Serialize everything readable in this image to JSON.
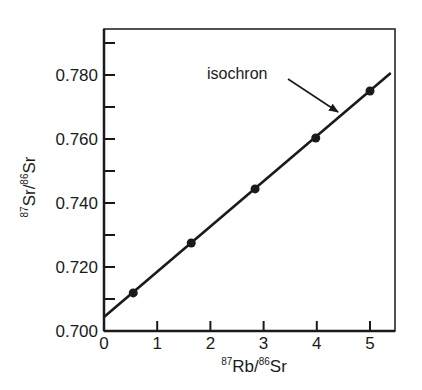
{
  "chart_data": {
    "type": "scatter",
    "title": "",
    "xlabel": {
      "sup1": "87",
      "main1": "Rb/",
      "sup2": "86",
      "main2": "Sr"
    },
    "ylabel": {
      "sup1": "87",
      "main1": "Sr/",
      "sup2": "86",
      "main2": "Sr"
    },
    "xlim": [
      0,
      5.47
    ],
    "ylim": [
      0.7,
      0.7945
    ],
    "x_ticks": [
      0,
      1,
      2,
      3,
      4,
      5
    ],
    "x_tick_labels": [
      "0",
      "1",
      "2",
      "3",
      "4",
      "5"
    ],
    "y_major_ticks": [
      0.7,
      0.72,
      0.74,
      0.76,
      0.78
    ],
    "y_tick_labels": [
      "0.700",
      "0.720",
      "0.740",
      "0.760",
      "0.780"
    ],
    "y_minor_ticks": [
      0.71,
      0.73,
      0.75,
      0.77,
      0.79
    ],
    "grid": false,
    "series": [
      {
        "name": "samples",
        "x": [
          0.55,
          1.64,
          2.84,
          3.98,
          5.0
        ],
        "y": [
          0.7119,
          0.7275,
          0.7444,
          0.7603,
          0.775
        ]
      }
    ],
    "fit_line": {
      "name": "isochron",
      "x": [
        0,
        5.39
      ],
      "y": [
        0.7044,
        0.7806
      ]
    },
    "annotations": [
      {
        "text": "isochron",
        "arrow_to": [
          4.42,
          0.7634
        ]
      }
    ]
  },
  "labels": {
    "annotation": "isochron"
  },
  "colors": {
    "ink": "#1a1a1a",
    "background": "#ffffff"
  }
}
